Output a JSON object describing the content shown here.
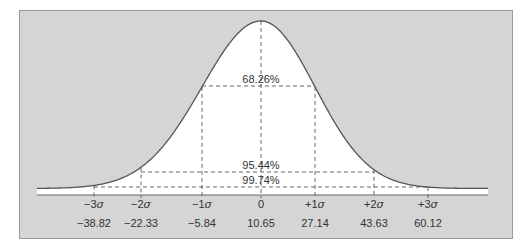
{
  "chart_data": {
    "type": "area",
    "title": "",
    "xlabel": "",
    "ylabel": "",
    "mean": 10.65,
    "sigma": 16.49,
    "sigma_labels": [
      "−3",
      "−2",
      "−1",
      "0",
      "+1",
      "+2",
      "+3"
    ],
    "sigma_has_symbol": [
      true,
      true,
      true,
      false,
      true,
      true,
      true
    ],
    "values": [
      "−38.82",
      "−22.33",
      "−5.84",
      "10.65",
      "27.14",
      "43.63",
      "60.12"
    ],
    "tick_x": [
      94,
      141,
      202,
      261,
      315,
      374,
      428
    ],
    "bands": [
      {
        "label": "68.26%",
        "range": "±1σ",
        "y": 86
      },
      {
        "label": "95.44%",
        "range": "±2σ",
        "y": 172
      },
      {
        "label": "99.74%",
        "range": "±3σ",
        "y": 187
      }
    ],
    "grid": false,
    "legend": "none"
  },
  "colors": {
    "panel": "#d5d5d5",
    "curve_fill": "#ffffff",
    "curve_stroke": "#555555",
    "dash": "#555555"
  }
}
